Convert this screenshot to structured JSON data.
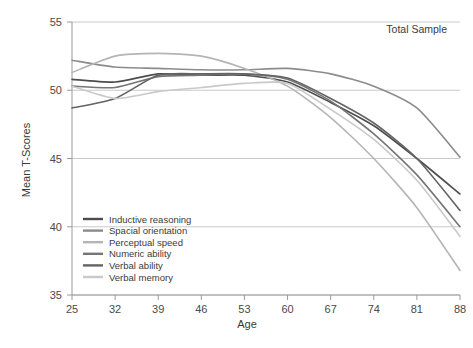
{
  "chart_data": {
    "type": "line",
    "title": "",
    "annotation": "Total Sample",
    "xlabel": "Age",
    "ylabel": "Mean T-Scores",
    "x": [
      25,
      32,
      39,
      46,
      53,
      60,
      67,
      74,
      81,
      88
    ],
    "categories": [
      "25",
      "32",
      "39",
      "46",
      "53",
      "60",
      "67",
      "74",
      "81",
      "88"
    ],
    "xtick_labels": [
      "25",
      "32",
      "39",
      "46",
      "53",
      "60",
      "67",
      "74",
      "81",
      "88"
    ],
    "ytick_labels": [
      "35",
      "40",
      "45",
      "50",
      "55"
    ],
    "yticks": [
      35,
      40,
      45,
      50,
      55
    ],
    "ylim": [
      35,
      55
    ],
    "xlim": [
      25,
      88
    ],
    "grid": "horizontal",
    "legend_position": "bottom-left",
    "series": [
      {
        "name": "Inductive reasoning",
        "color": "#4d4d4d",
        "values": [
          50.8,
          50.6,
          51.2,
          51.1,
          51.1,
          50.6,
          49.1,
          47.4,
          45.0,
          42.4
        ]
      },
      {
        "name": "Spacial orientation",
        "color": "#8c8c8c",
        "values": [
          52.2,
          51.7,
          51.6,
          51.5,
          51.5,
          51.6,
          51.2,
          50.3,
          48.7,
          45.1
        ]
      },
      {
        "name": "Perceptual speed",
        "color": "#b5b5b5",
        "values": [
          51.3,
          52.5,
          52.7,
          52.5,
          51.6,
          50.3,
          48.0,
          45.0,
          41.4,
          36.8
        ]
      },
      {
        "name": "Numeric ability",
        "color": "#767676",
        "values": [
          50.3,
          50.2,
          51.0,
          51.1,
          51.2,
          50.8,
          49.2,
          46.8,
          43.8,
          40.0
        ]
      },
      {
        "name": "Verbal ability",
        "color": "#646464",
        "values": [
          48.7,
          49.4,
          51.1,
          51.2,
          51.2,
          50.9,
          49.4,
          47.6,
          45.0,
          41.2
        ]
      },
      {
        "name": "Verbal memory",
        "color": "#c9c9c9",
        "values": [
          50.3,
          49.4,
          49.9,
          50.2,
          50.5,
          50.5,
          48.6,
          46.4,
          43.4,
          39.3
        ]
      }
    ]
  },
  "axes": {
    "y_title": "Mean T-Scores",
    "x_title": "Age"
  },
  "annotation": {
    "label": "Total Sample"
  },
  "legend": {
    "items": [
      {
        "label": "Inductive reasoning",
        "color": "#4d4d4d"
      },
      {
        "label": "Spacial orientation",
        "color": "#8c8c8c"
      },
      {
        "label": "Perceptual speed",
        "color": "#b5b5b5"
      },
      {
        "label": "Numeric ability",
        "color": "#767676"
      },
      {
        "label": "Verbal ability",
        "color": "#646464"
      },
      {
        "label": "Verbal memory",
        "color": "#c9c9c9"
      }
    ]
  },
  "colors": {
    "axis": "#9a9a9a",
    "grid": "#c4c4c4",
    "text": "#3a3a3a"
  }
}
